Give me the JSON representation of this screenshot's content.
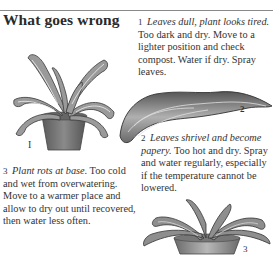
{
  "page": {
    "title": "What goes wrong"
  },
  "problems": [
    {
      "number": "1",
      "heading": "Leaves dull, plant looks tired.",
      "body": "Too dark and dry. Move to a lighter position and check compost. Water if dry. Spray leaves."
    },
    {
      "number": "2",
      "heading": "Leaves shrivel and become papery.",
      "body": "Too hot and dry. Spray and water regularly, especially if the temperature cannot be lowered."
    },
    {
      "number": "3",
      "heading": "Plant rots at base.",
      "body": "Too cold and wet from overwatering. Move to a warmer place and allow to dry out until recovered, then water less often."
    }
  ],
  "figures": [
    {
      "label": "I",
      "depicts": "potted plant with drooping dull leaves"
    },
    {
      "label": "2",
      "depicts": "single shrivelled papery leaf"
    },
    {
      "label": "3",
      "depicts": "low pot with plant rotting at base"
    }
  ],
  "colors": {
    "text": "#333333",
    "rule": "#8a8a8a",
    "background": "#ffffff"
  }
}
